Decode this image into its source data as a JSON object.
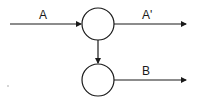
{
  "diagram": {
    "nodes": [
      {
        "id": "node-top",
        "cx": 98,
        "cy": 24,
        "r": 16
      },
      {
        "id": "node-bottom",
        "cx": 98,
        "cy": 80,
        "r": 16
      }
    ],
    "edges": [
      {
        "id": "edge-a",
        "label": "A",
        "from": "input",
        "to": "node-top"
      },
      {
        "id": "edge-a-prime",
        "label": "A'",
        "from": "node-top",
        "to": "output"
      },
      {
        "id": "edge-top-to-bottom",
        "label": "",
        "from": "node-top",
        "to": "node-bottom"
      },
      {
        "id": "edge-b",
        "label": "B",
        "from": "node-bottom",
        "to": "output"
      }
    ],
    "labels": {
      "a": "A",
      "a_prime": "A'",
      "b": "B"
    },
    "colors": {
      "stroke": "#1a1a1a",
      "background": "#ffffff"
    }
  }
}
